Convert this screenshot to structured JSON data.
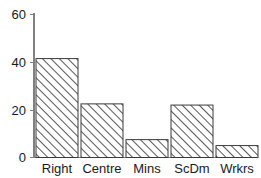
{
  "chart_data": {
    "type": "bar",
    "title": "",
    "subtitle": "",
    "xlabel": "",
    "ylabel": "",
    "categories": [
      "Right",
      "Centre",
      "Mins",
      "ScDm",
      "Wrkrs"
    ],
    "values": [
      41.5,
      22.5,
      7.5,
      22,
      5
    ],
    "ylim": [
      0,
      60
    ],
    "yticks": [
      0,
      20,
      40,
      60
    ],
    "ytick_labels": [
      "0",
      "20",
      "40",
      "60"
    ],
    "grid": false,
    "legend": null,
    "series": [
      {
        "name": "",
        "values": [
          41.5,
          22.5,
          7.5,
          22,
          5
        ]
      }
    ],
    "bar_style": {
      "fill": "diagonal-hatch",
      "hatch_color": "#3a3a3a",
      "background": "#ffffff",
      "edge_color": "#3a3a3a"
    },
    "axis_color": "#808080",
    "text_color": "#1a1a1a"
  },
  "axis": {
    "y_tick_0": "0",
    "y_tick_1": "20",
    "y_tick_2": "40",
    "y_tick_3": "60"
  },
  "categories": {
    "c0": "Right",
    "c1": "Centre",
    "c2": "Mins",
    "c3": "ScDm",
    "c4": "Wrkrs"
  }
}
